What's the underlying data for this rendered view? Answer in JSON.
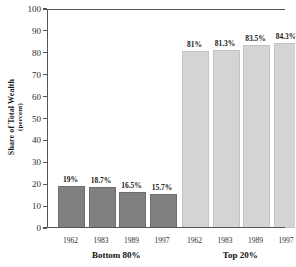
{
  "chart_data": {
    "type": "bar",
    "title": "",
    "xlabel": "",
    "ylabel": "Share of Total Wealth (percent)",
    "ylabel_main": "Share of Total Wealth",
    "ylabel_sub": "(percent)",
    "ylim": [
      0,
      100
    ],
    "ytick_step": 10,
    "yticks": [
      0,
      10,
      20,
      30,
      40,
      50,
      60,
      70,
      80,
      90,
      100
    ],
    "ytick_labels": [
      "0",
      "10",
      "20",
      "30",
      "40",
      "50",
      "60",
      "70",
      "80",
      "90",
      "100"
    ],
    "grid": false,
    "legend": "none",
    "categories": [
      "1962",
      "1983",
      "1989",
      "1997"
    ],
    "groups": [
      {
        "name": "Bottom 80%",
        "label": "Bottom 80%",
        "color": "#808080",
        "years": [
          "1962",
          "1983",
          "1989",
          "1997"
        ],
        "values": [
          19.0,
          18.7,
          16.5,
          15.7
        ],
        "value_labels": [
          "19%",
          "18.7%",
          "16.5%",
          "15.7%"
        ]
      },
      {
        "name": "Top 20%",
        "label": "Top 20%",
        "color": "#d4d4d4",
        "years": [
          "1962",
          "1983",
          "1989",
          "1997"
        ],
        "values": [
          81.0,
          81.3,
          83.5,
          84.3
        ],
        "value_labels": [
          "81%",
          "81.3%",
          "83.5%",
          "84.3%"
        ]
      }
    ]
  },
  "colors": {
    "bar_dark": "#808080",
    "bar_light": "#d4d4d4",
    "axis": "#555555",
    "text": "#1a1a1a",
    "background": "#ffffff"
  }
}
